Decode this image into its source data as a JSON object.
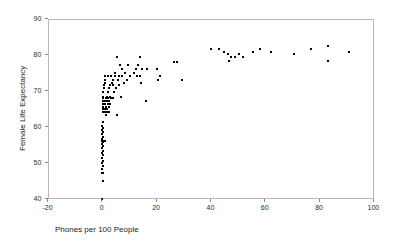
{
  "chart_data": {
    "type": "scatter",
    "title": "",
    "xlabel": "Phones per 100 People",
    "ylabel": "Female Life Expectancy",
    "xlim": [
      -20,
      100
    ],
    "ylim": [
      40,
      90
    ],
    "xticks": [
      -20,
      0,
      20,
      40,
      60,
      80,
      100
    ],
    "yticks": [
      40,
      50,
      60,
      70,
      80,
      90
    ],
    "xtick_labels": [
      "-20",
      "0",
      "20",
      "40",
      "60",
      "80",
      "100"
    ],
    "ytick_labels": [
      "40",
      "50",
      "60",
      "70",
      "80",
      "90"
    ],
    "grid": false,
    "legend": null,
    "marker": "square",
    "marker_color": "#000000",
    "frame_color": "#b9b9b9",
    "background": "#ffffff",
    "points": [
      [
        0.2,
        40.0
      ],
      [
        0.3,
        44.8
      ],
      [
        0.2,
        47.0
      ],
      [
        0.5,
        47.0
      ],
      [
        0.2,
        48.3
      ],
      [
        0.4,
        49.1
      ],
      [
        0.2,
        50.0
      ],
      [
        0.5,
        50.5
      ],
      [
        0.2,
        51.3
      ],
      [
        0.4,
        52.0
      ],
      [
        0.2,
        52.6
      ],
      [
        0.5,
        53.2
      ],
      [
        0.2,
        53.9
      ],
      [
        0.4,
        54.5
      ],
      [
        0.2,
        55.2
      ],
      [
        0.6,
        55.6
      ],
      [
        0.2,
        56.0
      ],
      [
        0.9,
        56.0
      ],
      [
        1.3,
        56.0
      ],
      [
        0.4,
        56.0
      ],
      [
        0.2,
        56.6
      ],
      [
        0.5,
        57.2
      ],
      [
        0.2,
        57.8
      ],
      [
        0.4,
        58.4
      ],
      [
        0.2,
        59.0
      ],
      [
        0.5,
        59.6
      ],
      [
        0.2,
        60.2
      ],
      [
        0.4,
        61.2
      ],
      [
        1.4,
        63.2
      ],
      [
        5.6,
        63.2
      ],
      [
        0.3,
        64.0
      ],
      [
        0.9,
        64.0
      ],
      [
        1.5,
        64.0
      ],
      [
        2.1,
        64.0
      ],
      [
        2.7,
        64.0
      ],
      [
        0.3,
        64.8
      ],
      [
        1.2,
        64.8
      ],
      [
        2.0,
        64.8
      ],
      [
        0.4,
        65.4
      ],
      [
        1.6,
        65.4
      ],
      [
        2.6,
        65.4
      ],
      [
        0.3,
        66.2
      ],
      [
        1.3,
        66.2
      ],
      [
        2.2,
        66.2
      ],
      [
        3.1,
        66.2
      ],
      [
        0.3,
        67.0
      ],
      [
        1.1,
        67.0
      ],
      [
        1.9,
        67.0
      ],
      [
        2.8,
        67.0
      ],
      [
        16.2,
        67.0
      ],
      [
        0.4,
        67.8
      ],
      [
        1.4,
        67.8
      ],
      [
        2.3,
        67.8
      ],
      [
        3.2,
        67.8
      ],
      [
        4.1,
        67.8
      ],
      [
        0.5,
        68.2
      ],
      [
        1.8,
        68.2
      ],
      [
        3.0,
        68.2
      ],
      [
        7.1,
        68.2
      ],
      [
        0.6,
        69.6
      ],
      [
        2.4,
        69.6
      ],
      [
        4.6,
        69.6
      ],
      [
        0.9,
        70.6
      ],
      [
        2.6,
        70.6
      ],
      [
        5.2,
        70.6
      ],
      [
        0.8,
        71.6
      ],
      [
        3.0,
        71.6
      ],
      [
        4.0,
        71.6
      ],
      [
        6.3,
        71.6
      ],
      [
        1.0,
        72.2
      ],
      [
        3.6,
        72.2
      ],
      [
        8.2,
        72.2
      ],
      [
        14.6,
        72.2
      ],
      [
        1.3,
        73.0
      ],
      [
        4.2,
        73.0
      ],
      [
        6.0,
        73.0
      ],
      [
        9.4,
        73.0
      ],
      [
        20.6,
        73.0
      ],
      [
        29.5,
        73.0
      ],
      [
        1.1,
        74.0
      ],
      [
        2.3,
        74.0
      ],
      [
        3.4,
        74.0
      ],
      [
        4.8,
        74.0
      ],
      [
        6.2,
        74.0
      ],
      [
        7.6,
        74.0
      ],
      [
        10.3,
        74.0
      ],
      [
        13.0,
        74.0
      ],
      [
        14.2,
        74.0
      ],
      [
        21.5,
        74.0
      ],
      [
        5.0,
        75.0
      ],
      [
        8.6,
        75.0
      ],
      [
        11.9,
        75.0
      ],
      [
        7.4,
        76.0
      ],
      [
        12.6,
        76.0
      ],
      [
        14.8,
        76.0
      ],
      [
        16.6,
        76.0
      ],
      [
        20.4,
        76.0
      ],
      [
        6.8,
        77.2
      ],
      [
        9.6,
        77.2
      ],
      [
        13.4,
        77.2
      ],
      [
        26.5,
        78.0
      ],
      [
        27.7,
        78.0
      ],
      [
        46.7,
        78.3
      ],
      [
        83.3,
        78.3
      ],
      [
        5.5,
        79.2
      ],
      [
        14.0,
        79.2
      ],
      [
        47.5,
        79.4
      ],
      [
        49.0,
        79.4
      ],
      [
        52.0,
        79.4
      ],
      [
        46.5,
        80.2
      ],
      [
        50.5,
        80.2
      ],
      [
        70.9,
        80.2
      ],
      [
        44.8,
        80.6
      ],
      [
        55.8,
        80.6
      ],
      [
        62.3,
        80.6
      ],
      [
        91.0,
        80.6
      ],
      [
        40.0,
        81.5
      ],
      [
        43.0,
        81.5
      ],
      [
        58.3,
        81.5
      ],
      [
        77.0,
        81.5
      ],
      [
        83.3,
        82.3
      ]
    ]
  },
  "axes": {
    "x_title": "Phones per 100 People",
    "y_title": "Female Life Expectancy"
  }
}
